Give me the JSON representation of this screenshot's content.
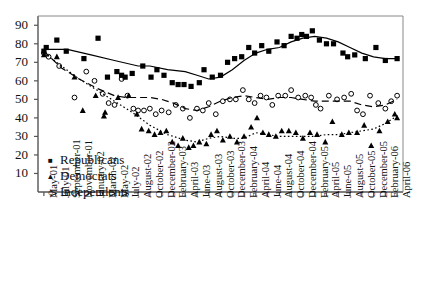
{
  "chart_data": {
    "type": "scatter",
    "title": "",
    "xlabel": "",
    "ylabel": "",
    "ylim": [
      0,
      95
    ],
    "yticks": [
      10,
      20,
      30,
      40,
      50,
      60,
      70,
      80,
      90
    ],
    "grid": false,
    "legend_position": "inner-bottom-left",
    "x": [
      "May-01",
      "July-01",
      "September-01",
      "November-01",
      "January-02",
      "March-02",
      "May-02",
      "July-02",
      "August-02",
      "October-02",
      "December-02",
      "February-03",
      "April-03",
      "June-03",
      "August-03",
      "October-03",
      "December-03",
      "February-04",
      "April-04",
      "June-04",
      "August-04",
      "October-04",
      "December-04",
      "February-05",
      "April-05",
      "June-05",
      "August-05",
      "October-05",
      "December-05",
      "February-06",
      "April-06"
    ],
    "xtick_labels": [
      "May-01",
      "July-01",
      "September-01",
      "November-01",
      "January-02",
      "March-02",
      "May-02",
      "July-02",
      "August-02",
      "October-02",
      "December-02",
      "February-03",
      "April-03",
      "June-03",
      "August-03",
      "October-03",
      "December-03",
      "February-04",
      "April-04",
      "June-04",
      "August-04",
      "October-04",
      "December-04",
      "February-05",
      "April-05",
      "June-05",
      "August-05",
      "October-05",
      "December-05",
      "February-06",
      "April-06"
    ],
    "series": [
      {
        "name": "Republicans",
        "marker": "filled-square",
        "line_style": "solid",
        "color": "#000000",
        "points": [
          {
            "x": 0.0,
            "y": 76
          },
          {
            "x": 0.2,
            "y": 78
          },
          {
            "x": 1.1,
            "y": 82
          },
          {
            "x": 1.9,
            "y": 76
          },
          {
            "x": 3.4,
            "y": 72
          },
          {
            "x": 4.6,
            "y": 83
          },
          {
            "x": 5.4,
            "y": 62
          },
          {
            "x": 6.2,
            "y": 65
          },
          {
            "x": 6.6,
            "y": 63
          },
          {
            "x": 6.9,
            "y": 62
          },
          {
            "x": 7.5,
            "y": 64
          },
          {
            "x": 8.4,
            "y": 68
          },
          {
            "x": 9.1,
            "y": 62
          },
          {
            "x": 9.6,
            "y": 66
          },
          {
            "x": 10.2,
            "y": 63
          },
          {
            "x": 10.9,
            "y": 59
          },
          {
            "x": 11.4,
            "y": 58
          },
          {
            "x": 11.9,
            "y": 58
          },
          {
            "x": 12.5,
            "y": 57
          },
          {
            "x": 13.2,
            "y": 59
          },
          {
            "x": 13.6,
            "y": 66
          },
          {
            "x": 14.3,
            "y": 62
          },
          {
            "x": 15.0,
            "y": 63
          },
          {
            "x": 15.6,
            "y": 70
          },
          {
            "x": 16.2,
            "y": 72
          },
          {
            "x": 16.8,
            "y": 73
          },
          {
            "x": 17.4,
            "y": 78
          },
          {
            "x": 17.9,
            "y": 75
          },
          {
            "x": 18.5,
            "y": 79
          },
          {
            "x": 19.1,
            "y": 76
          },
          {
            "x": 19.8,
            "y": 81
          },
          {
            "x": 20.4,
            "y": 79
          },
          {
            "x": 21.0,
            "y": 84
          },
          {
            "x": 21.5,
            "y": 83
          },
          {
            "x": 21.9,
            "y": 85
          },
          {
            "x": 22.3,
            "y": 84
          },
          {
            "x": 22.8,
            "y": 87
          },
          {
            "x": 23.4,
            "y": 82
          },
          {
            "x": 24.0,
            "y": 80
          },
          {
            "x": 24.6,
            "y": 80
          },
          {
            "x": 25.4,
            "y": 75
          },
          {
            "x": 25.8,
            "y": 73
          },
          {
            "x": 26.4,
            "y": 74
          },
          {
            "x": 27.3,
            "y": 72
          },
          {
            "x": 28.2,
            "y": 78
          },
          {
            "x": 29.0,
            "y": 71
          },
          {
            "x": 30.0,
            "y": 72
          }
        ],
        "trend": [
          {
            "x": 0.0,
            "y": 77
          },
          {
            "x": 2.0,
            "y": 77
          },
          {
            "x": 4.0,
            "y": 74
          },
          {
            "x": 6.0,
            "y": 71
          },
          {
            "x": 8.0,
            "y": 68
          },
          {
            "x": 9.0,
            "y": 68
          },
          {
            "x": 10.5,
            "y": 66
          },
          {
            "x": 12.0,
            "y": 65
          },
          {
            "x": 13.0,
            "y": 63
          },
          {
            "x": 14.0,
            "y": 61
          },
          {
            "x": 15.0,
            "y": 62
          },
          {
            "x": 16.0,
            "y": 66
          },
          {
            "x": 17.0,
            "y": 71
          },
          {
            "x": 18.0,
            "y": 75
          },
          {
            "x": 19.0,
            "y": 77
          },
          {
            "x": 20.0,
            "y": 78
          },
          {
            "x": 21.0,
            "y": 81
          },
          {
            "x": 22.0,
            "y": 83
          },
          {
            "x": 23.0,
            "y": 84
          },
          {
            "x": 24.0,
            "y": 83
          },
          {
            "x": 25.0,
            "y": 81
          },
          {
            "x": 26.0,
            "y": 78
          },
          {
            "x": 27.0,
            "y": 75
          },
          {
            "x": 28.0,
            "y": 73
          },
          {
            "x": 29.0,
            "y": 72
          },
          {
            "x": 30.0,
            "y": 72
          }
        ]
      },
      {
        "name": "Democrats",
        "marker": "filled-triangle",
        "line_style": "dotted",
        "color": "#000000",
        "points": [
          {
            "x": 0.0,
            "y": 74
          },
          {
            "x": 1.1,
            "y": 73
          },
          {
            "x": 2.6,
            "y": 62
          },
          {
            "x": 3.3,
            "y": 44
          },
          {
            "x": 4.4,
            "y": 52
          },
          {
            "x": 5.1,
            "y": 41
          },
          {
            "x": 5.2,
            "y": 43
          },
          {
            "x": 6.3,
            "y": 51
          },
          {
            "x": 7.2,
            "y": 52
          },
          {
            "x": 7.9,
            "y": 42
          },
          {
            "x": 8.3,
            "y": 34
          },
          {
            "x": 8.9,
            "y": 33
          },
          {
            "x": 9.4,
            "y": 31
          },
          {
            "x": 9.9,
            "y": 32
          },
          {
            "x": 10.4,
            "y": 33
          },
          {
            "x": 10.9,
            "y": 27
          },
          {
            "x": 11.4,
            "y": 25
          },
          {
            "x": 11.8,
            "y": 29
          },
          {
            "x": 12.3,
            "y": 24
          },
          {
            "x": 12.7,
            "y": 25
          },
          {
            "x": 13.2,
            "y": 27
          },
          {
            "x": 13.8,
            "y": 26
          },
          {
            "x": 14.2,
            "y": 31
          },
          {
            "x": 14.7,
            "y": 33
          },
          {
            "x": 15.2,
            "y": 28
          },
          {
            "x": 15.8,
            "y": 30
          },
          {
            "x": 16.4,
            "y": 27
          },
          {
            "x": 17.0,
            "y": 30
          },
          {
            "x": 17.6,
            "y": 35
          },
          {
            "x": 18.1,
            "y": 40
          },
          {
            "x": 18.6,
            "y": 32
          },
          {
            "x": 19.1,
            "y": 31
          },
          {
            "x": 19.7,
            "y": 30
          },
          {
            "x": 20.2,
            "y": 33
          },
          {
            "x": 20.8,
            "y": 33
          },
          {
            "x": 21.4,
            "y": 32
          },
          {
            "x": 22.0,
            "y": 29
          },
          {
            "x": 22.6,
            "y": 32
          },
          {
            "x": 23.2,
            "y": 31
          },
          {
            "x": 23.9,
            "y": 27
          },
          {
            "x": 24.5,
            "y": 38
          },
          {
            "x": 25.3,
            "y": 31
          },
          {
            "x": 25.9,
            "y": 32
          },
          {
            "x": 26.6,
            "y": 32
          },
          {
            "x": 27.2,
            "y": 36
          },
          {
            "x": 27.8,
            "y": 25
          },
          {
            "x": 28.5,
            "y": 33
          },
          {
            "x": 29.2,
            "y": 38
          },
          {
            "x": 29.8,
            "y": 42
          },
          {
            "x": 30.0,
            "y": 40
          }
        ],
        "trend": [
          {
            "x": 0.0,
            "y": 75
          },
          {
            "x": 1.5,
            "y": 68
          },
          {
            "x": 3.0,
            "y": 61
          },
          {
            "x": 4.5,
            "y": 55
          },
          {
            "x": 6.0,
            "y": 49
          },
          {
            "x": 7.5,
            "y": 43
          },
          {
            "x": 9.0,
            "y": 36
          },
          {
            "x": 10.5,
            "y": 31
          },
          {
            "x": 12.0,
            "y": 28
          },
          {
            "x": 13.0,
            "y": 27
          },
          {
            "x": 14.0,
            "y": 29
          },
          {
            "x": 15.0,
            "y": 30
          },
          {
            "x": 16.0,
            "y": 29
          },
          {
            "x": 17.0,
            "y": 29
          },
          {
            "x": 18.0,
            "y": 32
          },
          {
            "x": 19.0,
            "y": 31
          },
          {
            "x": 20.0,
            "y": 30
          },
          {
            "x": 21.0,
            "y": 30
          },
          {
            "x": 22.0,
            "y": 30
          },
          {
            "x": 23.0,
            "y": 30
          },
          {
            "x": 24.0,
            "y": 31
          },
          {
            "x": 25.0,
            "y": 31
          },
          {
            "x": 26.0,
            "y": 32
          },
          {
            "x": 27.0,
            "y": 33
          },
          {
            "x": 28.0,
            "y": 34
          },
          {
            "x": 29.0,
            "y": 37
          },
          {
            "x": 30.0,
            "y": 41
          }
        ]
      },
      {
        "name": "Independents",
        "marker": "open-circle",
        "line_style": "dashed",
        "color": "#000000",
        "points": [
          {
            "x": 0.0,
            "y": 75
          },
          {
            "x": 0.4,
            "y": 73
          },
          {
            "x": 1.3,
            "y": 68
          },
          {
            "x": 2.6,
            "y": 51
          },
          {
            "x": 3.6,
            "y": 65
          },
          {
            "x": 4.3,
            "y": 60
          },
          {
            "x": 5.0,
            "y": 53
          },
          {
            "x": 5.5,
            "y": 48
          },
          {
            "x": 6.0,
            "y": 47
          },
          {
            "x": 6.6,
            "y": 61
          },
          {
            "x": 7.1,
            "y": 52
          },
          {
            "x": 7.6,
            "y": 45
          },
          {
            "x": 8.0,
            "y": 44
          },
          {
            "x": 8.5,
            "y": 44
          },
          {
            "x": 9.0,
            "y": 45
          },
          {
            "x": 9.5,
            "y": 42
          },
          {
            "x": 10.0,
            "y": 44
          },
          {
            "x": 10.6,
            "y": 43
          },
          {
            "x": 11.2,
            "y": 47
          },
          {
            "x": 11.8,
            "y": 45
          },
          {
            "x": 12.4,
            "y": 40
          },
          {
            "x": 13.0,
            "y": 45
          },
          {
            "x": 13.5,
            "y": 44
          },
          {
            "x": 14.0,
            "y": 48
          },
          {
            "x": 14.6,
            "y": 42
          },
          {
            "x": 15.2,
            "y": 49
          },
          {
            "x": 15.8,
            "y": 50
          },
          {
            "x": 16.3,
            "y": 50
          },
          {
            "x": 16.9,
            "y": 55
          },
          {
            "x": 17.4,
            "y": 50
          },
          {
            "x": 17.9,
            "y": 48
          },
          {
            "x": 18.4,
            "y": 52
          },
          {
            "x": 18.9,
            "y": 51
          },
          {
            "x": 19.4,
            "y": 47
          },
          {
            "x": 19.9,
            "y": 52
          },
          {
            "x": 20.5,
            "y": 52
          },
          {
            "x": 21.0,
            "y": 55
          },
          {
            "x": 21.6,
            "y": 51
          },
          {
            "x": 22.2,
            "y": 52
          },
          {
            "x": 22.7,
            "y": 51
          },
          {
            "x": 23.1,
            "y": 47
          },
          {
            "x": 23.5,
            "y": 45
          },
          {
            "x": 24.2,
            "y": 52
          },
          {
            "x": 24.9,
            "y": 50
          },
          {
            "x": 25.5,
            "y": 51
          },
          {
            "x": 26.1,
            "y": 53
          },
          {
            "x": 26.6,
            "y": 44
          },
          {
            "x": 27.1,
            "y": 42
          },
          {
            "x": 27.7,
            "y": 52
          },
          {
            "x": 28.4,
            "y": 48
          },
          {
            "x": 29.0,
            "y": 45
          },
          {
            "x": 29.5,
            "y": 49
          },
          {
            "x": 30.0,
            "y": 52
          }
        ],
        "trend": [
          {
            "x": 0.0,
            "y": 76
          },
          {
            "x": 1.5,
            "y": 67
          },
          {
            "x": 3.0,
            "y": 61
          },
          {
            "x": 4.5,
            "y": 56
          },
          {
            "x": 6.0,
            "y": 52
          },
          {
            "x": 7.0,
            "y": 51
          },
          {
            "x": 8.0,
            "y": 51
          },
          {
            "x": 9.0,
            "y": 51
          },
          {
            "x": 10.0,
            "y": 50
          },
          {
            "x": 11.0,
            "y": 48
          },
          {
            "x": 12.0,
            "y": 45
          },
          {
            "x": 13.0,
            "y": 44
          },
          {
            "x": 14.0,
            "y": 46
          },
          {
            "x": 15.0,
            "y": 49
          },
          {
            "x": 16.0,
            "y": 51
          },
          {
            "x": 17.0,
            "y": 52
          },
          {
            "x": 18.0,
            "y": 51
          },
          {
            "x": 19.0,
            "y": 50
          },
          {
            "x": 20.0,
            "y": 51
          },
          {
            "x": 21.0,
            "y": 51
          },
          {
            "x": 22.0,
            "y": 50
          },
          {
            "x": 23.0,
            "y": 49
          },
          {
            "x": 24.0,
            "y": 49
          },
          {
            "x": 25.0,
            "y": 49
          },
          {
            "x": 26.0,
            "y": 49
          },
          {
            "x": 27.0,
            "y": 47
          },
          {
            "x": 28.0,
            "y": 46
          },
          {
            "x": 29.0,
            "y": 47
          },
          {
            "x": 30.0,
            "y": 50
          }
        ]
      }
    ],
    "legend": [
      {
        "label": "Republicans",
        "symbol": "■"
      },
      {
        "label": "Democrats",
        "symbol": "▲"
      },
      {
        "label": "Independents",
        "symbol": "○"
      }
    ]
  }
}
